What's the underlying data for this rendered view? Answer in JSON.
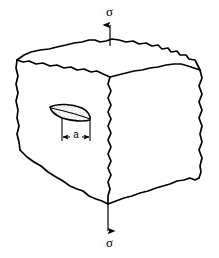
{
  "figure": {
    "kind": "engineering-diagram",
    "background_color": "#ffffff",
    "line_color": "#000000"
  },
  "labels": {
    "stress_top": "σ",
    "stress_bottom": "σ",
    "crack_size": "a"
  },
  "icons": {
    "arrow_up": "arrow-up-icon",
    "arrow_down": "arrow-down-icon",
    "dimension_arrow_left": "dimension-arrow-left-icon",
    "dimension_arrow_right": "dimension-arrow-right-icon"
  },
  "geometry": {
    "cube": {
      "front_top_left": [
        17,
        60
      ],
      "front_top_right": [
        110,
        77
      ],
      "front_bottom_left": [
        20,
        150
      ],
      "front_bottom_vertex": [
        108,
        204
      ],
      "back_top_center": [
        95,
        40
      ],
      "right_top": [
        200,
        70
      ],
      "right_bottom": [
        199,
        178
      ]
    },
    "crack": {
      "center": [
        70,
        112
      ],
      "width": 40,
      "height": 15,
      "fill": "#ffffff",
      "stipple": true
    },
    "dimension_line": {
      "y": 137,
      "x_start": 62,
      "x_end": 90
    },
    "load_arrow_top": {
      "x": 110,
      "y_start": 44,
      "y_end": 24
    },
    "load_arrow_bottom": {
      "x": 108,
      "y_start": 205,
      "y_end": 232
    }
  },
  "colors": {
    "ink": "#000000",
    "paper": "#ffffff",
    "stipple": "#555555"
  }
}
